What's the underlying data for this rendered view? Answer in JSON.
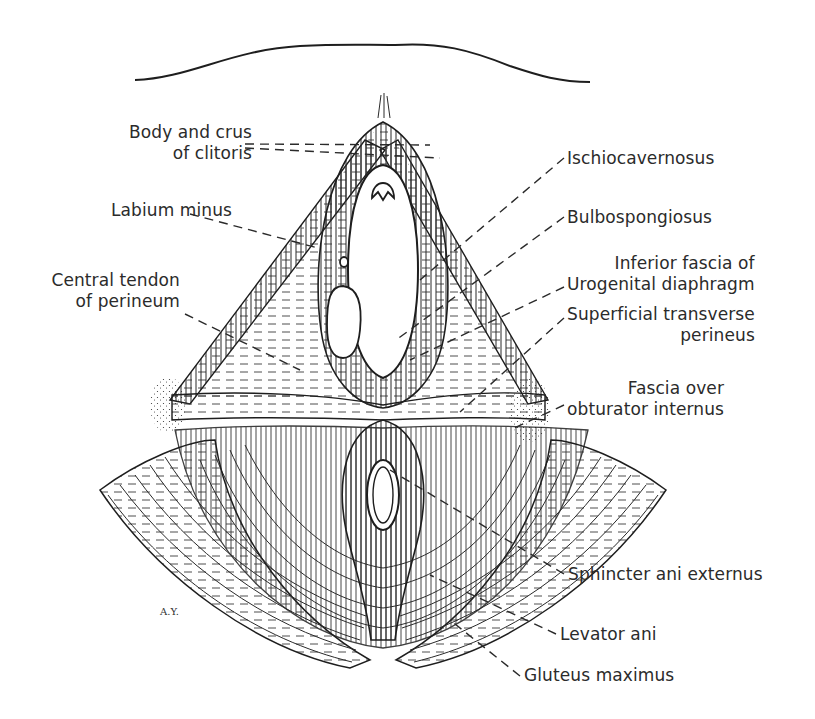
{
  "figure": {
    "type": "anatomical-illustration",
    "signature": "A.Y."
  },
  "labels": [
    {
      "id": "body-crus-clitoris",
      "lines": [
        "Body and crus",
        "of clitoris"
      ],
      "side": "left",
      "x": 12,
      "y": 122,
      "w": 240
    },
    {
      "id": "labium-minus",
      "lines": [
        "Labium minus"
      ],
      "side": "left",
      "x": 12,
      "y": 200,
      "w": 220
    },
    {
      "id": "central-tendon",
      "lines": [
        "Central tendon",
        "of perineum"
      ],
      "side": "left",
      "x": 12,
      "y": 270,
      "w": 168
    },
    {
      "id": "ischiocavernosus",
      "lines": [
        "Ischiocavernosus"
      ],
      "side": "right",
      "x": 567,
      "y": 148
    },
    {
      "id": "bulbospongiosus",
      "lines": [
        "Bulbospongiosus"
      ],
      "side": "right",
      "x": 567,
      "y": 207
    },
    {
      "id": "inferior-fascia",
      "lines": [
        "Inferior fascia of",
        "Urogenital diaphragm"
      ],
      "side": "right",
      "x": 567,
      "y": 253
    },
    {
      "id": "superficial-transverse",
      "lines": [
        "Superficial transverse",
        "perineus"
      ],
      "side": "right",
      "x": 567,
      "y": 304
    },
    {
      "id": "fascia-obturator",
      "lines": [
        "Fascia over",
        "obturator internus"
      ],
      "side": "right",
      "x": 567,
      "y": 378
    },
    {
      "id": "sphincter-ani",
      "lines": [
        "Sphincter ani externus"
      ],
      "side": "right",
      "x": 568,
      "y": 564
    },
    {
      "id": "levator-ani",
      "lines": [
        "Levator ani"
      ],
      "side": "right",
      "x": 560,
      "y": 624
    },
    {
      "id": "gluteus-maximus",
      "lines": [
        "Gluteus maximus"
      ],
      "side": "right",
      "x": 524,
      "y": 665
    }
  ],
  "leaders": [
    {
      "for": "body-crus-clitoris",
      "x1": 245,
      "y1": 144,
      "x2": 430,
      "y2": 145
    },
    {
      "for": "body-crus-clitoris",
      "x1": 245,
      "y1": 148,
      "x2": 440,
      "y2": 158
    },
    {
      "for": "labium-minus",
      "x1": 190,
      "y1": 214,
      "x2": 318,
      "y2": 248
    },
    {
      "for": "central-tendon",
      "x1": 185,
      "y1": 314,
      "x2": 300,
      "y2": 370
    },
    {
      "for": "ischiocavernosus",
      "x1": 564,
      "y1": 158,
      "x2": 420,
      "y2": 280
    },
    {
      "for": "bulbospongiosus",
      "x1": 564,
      "y1": 217,
      "x2": 396,
      "y2": 340
    },
    {
      "for": "inferior-fascia",
      "x1": 564,
      "y1": 287,
      "x2": 410,
      "y2": 360
    },
    {
      "for": "superficial-transverse",
      "x1": 564,
      "y1": 318,
      "x2": 460,
      "y2": 412
    },
    {
      "for": "fascia-obturator",
      "x1": 564,
      "y1": 405,
      "x2": 510,
      "y2": 430
    },
    {
      "for": "sphincter-ani",
      "x1": 564,
      "y1": 574,
      "x2": 390,
      "y2": 470
    },
    {
      "for": "levator-ani",
      "x1": 556,
      "y1": 634,
      "x2": 430,
      "y2": 575
    },
    {
      "for": "gluteus-maximus",
      "x1": 520,
      "y1": 676,
      "x2": 450,
      "y2": 620
    }
  ],
  "colors": {
    "ink": "#2a2a2a",
    "background": "#ffffff"
  }
}
